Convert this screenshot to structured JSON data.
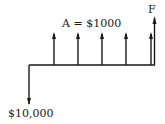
{
  "diagram": {
    "type": "cash-flow-diagram",
    "labels": {
      "annuity": "A = $1000",
      "future": "F",
      "present": "$10,000"
    },
    "present_value": 10000,
    "annuity_amount": 1000,
    "periods": 5,
    "colors": {
      "stroke": "#1a1a1a",
      "background": "#ffffff"
    }
  }
}
